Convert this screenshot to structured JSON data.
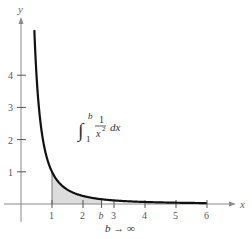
{
  "chart_data": {
    "type": "line",
    "title": "",
    "function": "y = 1/x^2",
    "xlabel": "x",
    "ylabel": "y",
    "xlim": [
      0,
      6.5
    ],
    "ylim": [
      0,
      5.5
    ],
    "grid": false,
    "legend": null,
    "x_ticks": [
      "1",
      "2",
      "3",
      "4",
      "5",
      "6"
    ],
    "y_ticks": [
      "1",
      "2",
      "3",
      "4"
    ],
    "special_tick": {
      "label": "b",
      "x": 2.6
    },
    "series": [
      {
        "name": "1/x^2",
        "x": [
          0.45,
          0.5,
          0.6,
          0.7,
          0.8,
          1.0,
          1.25,
          1.5,
          2.0,
          2.6,
          3,
          4,
          5,
          6
        ],
        "y": [
          4.94,
          4.0,
          2.78,
          2.04,
          1.56,
          1.0,
          0.64,
          0.44,
          0.25,
          0.15,
          0.11,
          0.06,
          0.04,
          0.03
        ]
      }
    ],
    "shaded_region": {
      "from": 1,
      "to": "b",
      "under": "1/x^2",
      "color": "#dcdcdc"
    },
    "annotations": {
      "integral": {
        "integral_sign": "∫",
        "upper": "b",
        "lower": "1",
        "numerator": "1",
        "denominator": "x",
        "exponent": "2",
        "differential": "dx"
      },
      "limit": "b → ∞"
    }
  },
  "axes": {
    "x_label": "x",
    "y_label": "y"
  },
  "labels": {
    "limit": "b → ∞"
  },
  "colors": {
    "curve": "#111111",
    "shade": "#dcdcdc",
    "axis": "#8a8a8a"
  }
}
